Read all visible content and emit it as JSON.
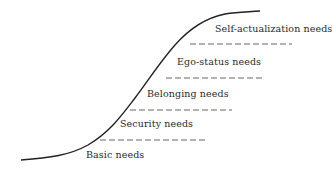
{
  "diagram": {
    "type": "hierarchy-of-needs-curve",
    "curve_color": "#222222",
    "dash_color": "#555555",
    "levels": [
      {
        "label": "Self-actualization needs"
      },
      {
        "label": "Ego-status needs"
      },
      {
        "label": "Belonging needs"
      },
      {
        "label": "Security needs"
      },
      {
        "label": "Basic needs"
      }
    ]
  }
}
